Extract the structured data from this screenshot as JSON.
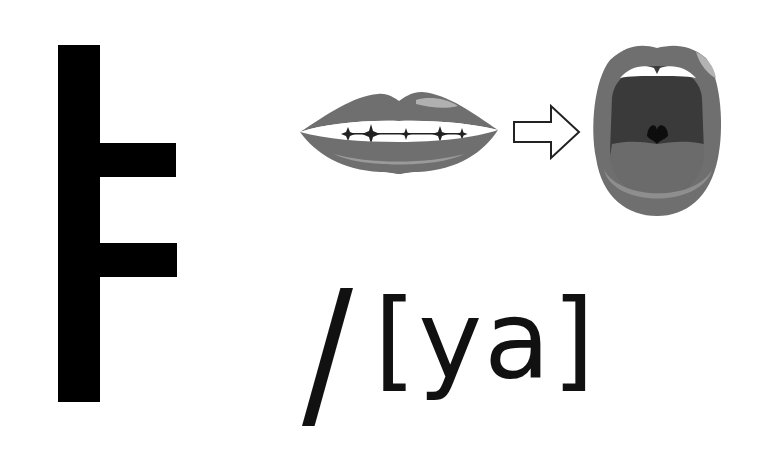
{
  "card": {
    "hangul_letter": "ㅑ",
    "slash": "/",
    "romanization": "[ya]",
    "illustrations": [
      {
        "name": "closed-lips",
        "description": "closed smiling lips showing teeth with sparkles"
      },
      {
        "name": "right-arrow",
        "description": "outline arrow pointing right"
      },
      {
        "name": "open-mouth",
        "description": "wide open mouth showing tongue and uvula"
      }
    ]
  },
  "colors": {
    "background": "#ffffff",
    "glyph": "#000000",
    "text": "#111111",
    "lip": "#6f6f6f",
    "lip_dark": "#5a5a5a",
    "lip_highlight": "#a9a9a9",
    "mouth_inside": "#3a3a3a",
    "tongue": "#6a6a6a",
    "teeth": "#ffffff"
  }
}
